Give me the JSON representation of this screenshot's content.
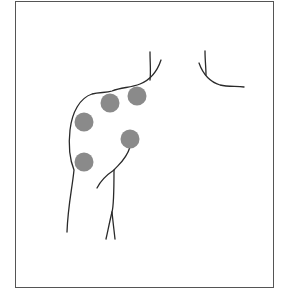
{
  "figure": {
    "type": "anatomical-diagram",
    "frame_color": "#555555",
    "line_color": "#2a2a2a",
    "point_color": "#8a8a8a",
    "points": [
      {
        "id": "p1",
        "cx": 110,
        "cy": 103,
        "r": 9.5
      },
      {
        "id": "p2",
        "cx": 137,
        "cy": 96,
        "r": 9.5
      },
      {
        "id": "p3",
        "cx": 84,
        "cy": 122,
        "r": 9.5
      },
      {
        "id": "p4",
        "cx": 130,
        "cy": 139,
        "r": 9.5
      },
      {
        "id": "p5",
        "cx": 84,
        "cy": 162,
        "r": 9.5
      }
    ]
  }
}
